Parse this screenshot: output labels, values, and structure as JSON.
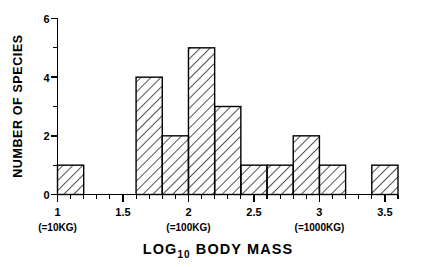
{
  "chart_data": {
    "type": "bar",
    "title": "",
    "xlabel": "LOG10 BODY MASS",
    "xlabel_main": "LOG",
    "xlabel_sub": "10",
    "xlabel_rest": "BODY MASS",
    "ylabel": "NUMBER OF SPECIES",
    "xlim": [
      1.0,
      3.6
    ],
    "ylim": [
      0,
      6
    ],
    "grid": false,
    "legend": "none",
    "bin_width": 0.2,
    "bin_edges": [
      1.0,
      1.2,
      1.4,
      1.6,
      1.8,
      2.0,
      2.2,
      2.4,
      2.6,
      2.8,
      3.0,
      3.2,
      3.4,
      3.6
    ],
    "categories": [
      "1.0-1.2",
      "1.2-1.4",
      "1.4-1.6",
      "1.6-1.8",
      "1.8-2.0",
      "2.0-2.2",
      "2.2-2.4",
      "2.4-2.6",
      "2.6-2.8",
      "2.8-3.0",
      "3.0-3.2",
      "3.2-3.4",
      "3.4-3.6"
    ],
    "values": [
      1,
      0,
      0,
      4,
      2,
      5,
      3,
      1,
      1,
      2,
      1,
      0,
      1
    ],
    "bars": [
      {
        "x0": 1.0,
        "x1": 1.2,
        "count": 1
      },
      {
        "x0": 1.6,
        "x1": 1.8,
        "count": 4
      },
      {
        "x0": 1.8,
        "x1": 2.0,
        "count": 2
      },
      {
        "x0": 2.0,
        "x1": 2.2,
        "count": 5
      },
      {
        "x0": 2.2,
        "x1": 2.4,
        "count": 3
      },
      {
        "x0": 2.4,
        "x1": 2.6,
        "count": 1
      },
      {
        "x0": 2.6,
        "x1": 2.8,
        "count": 1
      },
      {
        "x0": 2.8,
        "x1": 3.0,
        "count": 2
      },
      {
        "x0": 3.0,
        "x1": 3.2,
        "count": 1
      },
      {
        "x0": 3.4,
        "x1": 3.6,
        "count": 1
      }
    ],
    "x_ticks_major": [
      1,
      1.5,
      2,
      2.5,
      3,
      3.5
    ],
    "x_tick_labels": [
      "1",
      "1.5",
      "2",
      "2.5",
      "3",
      "3.5"
    ],
    "x_tick_minor_step": 0.1,
    "x_sub_annotations": [
      {
        "at": 1,
        "text": "(=10KG)"
      },
      {
        "at": 2,
        "text": "(=100KG)"
      },
      {
        "at": 3,
        "text": "(=1000KG)"
      }
    ],
    "y_ticks_major": [
      0,
      2,
      4,
      6
    ],
    "y_tick_labels": [
      "0",
      "2",
      "4",
      "6"
    ],
    "y_ticks_minor": [
      1,
      3,
      5
    ],
    "bar_style": "diagonal-hatch",
    "colors": {
      "axis": "#000000",
      "bar_outline": "#000000",
      "hatch": "#1a1a1a",
      "background": "#ffffff"
    }
  }
}
